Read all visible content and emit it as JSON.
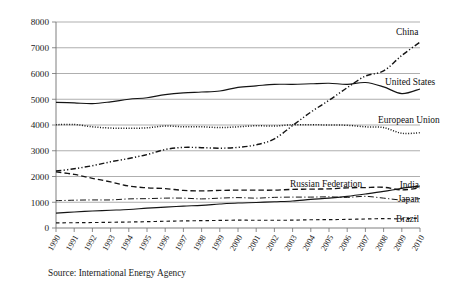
{
  "figure": {
    "source_note": "Source: International Energy Agency",
    "background_color": "#ffffff",
    "line_color": "#141414"
  },
  "chart_data": {
    "type": "line",
    "title": "",
    "subtitle": "",
    "xlabel": "",
    "ylabel": "",
    "grid": true,
    "legend_position": "inline-right-labels",
    "xlim": [
      1990,
      2010
    ],
    "ylim": [
      0,
      8000
    ],
    "yticks": [
      0,
      1000,
      2000,
      3000,
      4000,
      5000,
      6000,
      7000,
      8000
    ],
    "ytick_labels": [
      "0",
      "1000",
      "2000",
      "3000",
      "4000",
      "5000",
      "6000",
      "7000",
      "8000"
    ],
    "x": [
      1990,
      1991,
      1992,
      1993,
      1994,
      1995,
      1996,
      1997,
      1998,
      1999,
      2000,
      2001,
      2002,
      2003,
      2004,
      2005,
      2006,
      2007,
      2008,
      2009,
      2010
    ],
    "categories": [
      "1990",
      "1991",
      "1992",
      "1993",
      "1994",
      "1995",
      "1996",
      "1997",
      "1998",
      "1999",
      "2000",
      "2001",
      "2002",
      "2003",
      "2004",
      "2005",
      "2006",
      "2007",
      "2008",
      "2009",
      "2010"
    ],
    "series": [
      {
        "name": "China",
        "label": "China",
        "style": "dash-dot-dot",
        "values": [
          2210,
          2300,
          2420,
          2570,
          2700,
          2850,
          3050,
          3130,
          3120,
          3100,
          3130,
          3230,
          3460,
          3980,
          4500,
          4960,
          5450,
          5900,
          6100,
          6700,
          7220
        ]
      },
      {
        "name": "United States",
        "label": "United States",
        "style": "solid",
        "values": [
          4880,
          4860,
          4830,
          4900,
          5000,
          5060,
          5180,
          5250,
          5280,
          5320,
          5460,
          5520,
          5580,
          5580,
          5600,
          5620,
          5580,
          5650,
          5480,
          5220,
          5400
        ]
      },
      {
        "name": "European Union",
        "label": "European Union",
        "style": "dotted",
        "values": [
          4010,
          4020,
          3930,
          3880,
          3870,
          3890,
          3960,
          3930,
          3930,
          3900,
          3930,
          3970,
          3960,
          4010,
          4010,
          4000,
          3990,
          3930,
          3900,
          3680,
          3700
        ]
      },
      {
        "name": "Russian Federation",
        "label": "Russian Federation",
        "style": "dashed",
        "values": [
          2180,
          2080,
          1930,
          1790,
          1630,
          1560,
          1530,
          1460,
          1440,
          1460,
          1470,
          1470,
          1470,
          1500,
          1510,
          1520,
          1560,
          1570,
          1580,
          1480,
          1560
        ]
      },
      {
        "name": "Japan",
        "label": "Japan",
        "style": "dash-dot",
        "values": [
          1060,
          1080,
          1090,
          1090,
          1130,
          1140,
          1160,
          1160,
          1130,
          1160,
          1180,
          1160,
          1190,
          1200,
          1200,
          1210,
          1190,
          1230,
          1160,
          1090,
          1140
        ]
      },
      {
        "name": "India",
        "label": "India",
        "style": "solid",
        "values": [
          580,
          620,
          660,
          690,
          720,
          770,
          810,
          850,
          880,
          930,
          970,
          990,
          1020,
          1050,
          1110,
          1160,
          1230,
          1320,
          1420,
          1540,
          1630
        ]
      },
      {
        "name": "Brazil",
        "label": "Brazil",
        "style": "short-dash",
        "values": [
          200,
          205,
          212,
          222,
          232,
          246,
          262,
          275,
          285,
          295,
          305,
          300,
          300,
          305,
          320,
          325,
          335,
          350,
          365,
          355,
          390
        ]
      }
    ],
    "annotations": [
      {
        "text": "China",
        "for": "China"
      },
      {
        "text": "United States",
        "for": "United States"
      },
      {
        "text": "European Union",
        "for": "European Union"
      },
      {
        "text": "Russian Federation",
        "for": "Russian Federation"
      },
      {
        "text": "India",
        "for": "India"
      },
      {
        "text": "Japan",
        "for": "Japan"
      },
      {
        "text": "Brazil",
        "for": "Brazil"
      }
    ]
  }
}
